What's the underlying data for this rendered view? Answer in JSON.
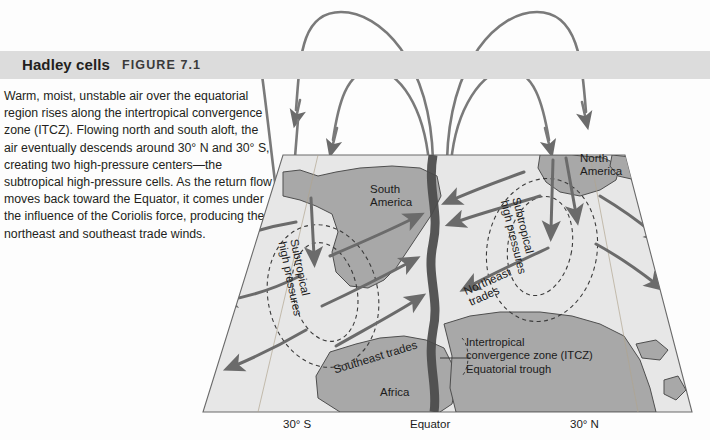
{
  "figure": {
    "title": "Hadley cells",
    "figure_number": "FIGURE 7.1",
    "caption": "Warm, moist, unstable air over the equatorial region rises along the intertropical convergence zone (ITCZ). Flowing north and south aloft, the air eventually descends around 30° N and 30° S, creating two high-pressure centers—the subtropical high-pressure cells. As the return flow moves back toward the Equator, it comes under the influence of the Coriolis force, producing the northeast and southeast trade winds."
  },
  "diagram": {
    "continents": {
      "south_america": "South\nAmerica",
      "south_america_line1": "South",
      "south_america_line2": "America",
      "north_america_line1": "North",
      "north_america_line2": "America",
      "africa": "Africa"
    },
    "pressure_cells": {
      "left_line1": "Subtropical",
      "left_line2": "high pressures",
      "right_line1": "Subtropical",
      "right_line2": "high pressures"
    },
    "trade_winds": {
      "northeast_line1": "Northeast",
      "northeast_line2": "trades",
      "southeast": "Southeast trades"
    },
    "itcz": {
      "line1": "Intertropical",
      "line2": "convergence zone (ITCZ)",
      "line3": "Equatorial trough"
    },
    "axis_labels": {
      "left": "30° S",
      "center": "Equator",
      "right": "30° N"
    }
  },
  "colors": {
    "header_band": "#dcdcdc",
    "ocean": "#e8e8e8",
    "land": "#a8a8a8",
    "arrow": "#6e6e6e",
    "itcz_band": "#4a4a4a",
    "text": "#231f20"
  }
}
